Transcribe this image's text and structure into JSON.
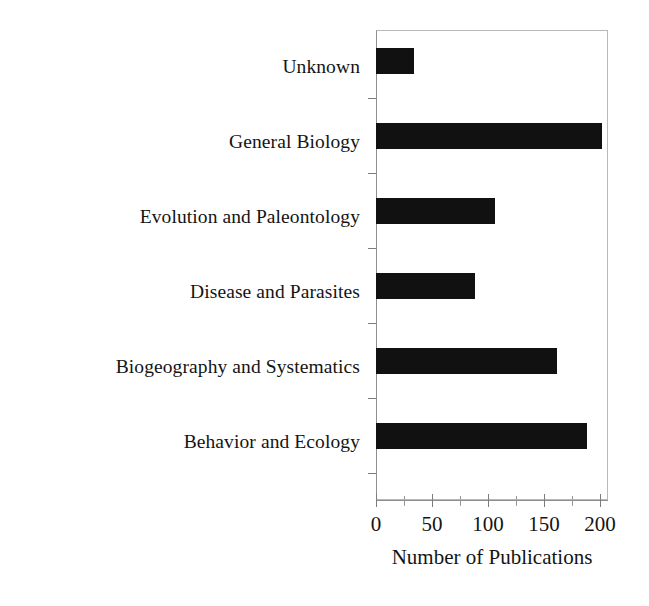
{
  "chart_data": {
    "type": "bar",
    "orientation": "horizontal",
    "title": "",
    "xlabel": "Number of Publications",
    "ylabel": "",
    "categories": [
      "Unknown",
      "General Biology",
      "Evolution and Paleontology",
      "Disease and Parasites",
      "Biogeography and Systematics",
      "Behavior and Ecology"
    ],
    "values": [
      33,
      195,
      103,
      85,
      156,
      182
    ],
    "xlim": [
      0,
      200
    ],
    "xticks": [
      0,
      50,
      100,
      150,
      200
    ],
    "xtick_labels": [
      "0",
      "50",
      "100",
      "150",
      "200"
    ],
    "minor_xticks": [
      25,
      75,
      125,
      175
    ],
    "grid": false,
    "legend": false,
    "bar_color": "#111111",
    "axis_color": "#8e8e8e",
    "text_color": "#141414"
  },
  "axis": {
    "x_title": "Number of Publications",
    "tick_labels": [
      "0",
      "50",
      "100",
      "150",
      "200"
    ]
  },
  "categories": [
    {
      "label": "Unknown",
      "value": 33
    },
    {
      "label": "General Biology",
      "value": 195
    },
    {
      "label": "Evolution and Paleontology",
      "value": 103
    },
    {
      "label": "Disease and Parasites",
      "value": 85
    },
    {
      "label": "Biogeography and Systematics",
      "value": 156
    },
    {
      "label": "Behavior and Ecology",
      "value": 182
    }
  ]
}
